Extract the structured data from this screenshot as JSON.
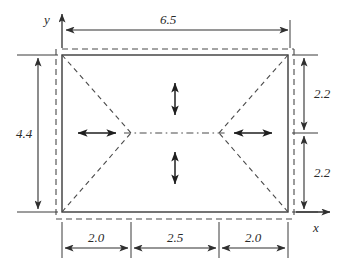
{
  "diagram": {
    "axes": {
      "x_label": "x",
      "y_label": "y"
    },
    "dimensions": {
      "top": {
        "label": "6.5",
        "orientation": "horizontal",
        "span": "full-width"
      },
      "left": {
        "label": "4.4",
        "orientation": "vertical",
        "span": "full-height"
      },
      "right_upper": {
        "label": "2.2",
        "orientation": "vertical"
      },
      "right_lower": {
        "label": "2.2",
        "orientation": "vertical"
      },
      "bottom_left": {
        "label": "2.0",
        "orientation": "horizontal"
      },
      "bottom_middle": {
        "label": "2.5",
        "orientation": "horizontal"
      },
      "bottom_right": {
        "label": "2.0",
        "orientation": "horizontal"
      }
    },
    "load_arrows": {
      "left": "horizontal-double-arrow",
      "right": "horizontal-double-arrow",
      "top": "vertical-double-arrow",
      "bottom": "vertical-double-arrow"
    },
    "colors": {
      "line": "#3a3a3a",
      "text": "#2a2a2a",
      "background": "#ffffff"
    }
  }
}
